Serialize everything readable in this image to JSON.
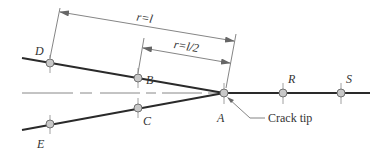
{
  "diagram": {
    "type": "crack-tip quarter-point element geometry",
    "colors": {
      "line": "#2a2a2a",
      "thin_line": "#555555",
      "node_fill": "#c8c8c8",
      "node_stroke": "#666666",
      "background": "#ffffff"
    },
    "dimensions": [
      {
        "label": "r=l"
      },
      {
        "label": "r=l/2"
      }
    ],
    "nodes": [
      {
        "id": "D",
        "label": "D"
      },
      {
        "id": "B",
        "label": "B"
      },
      {
        "id": "A",
        "label": "A"
      },
      {
        "id": "C",
        "label": "C"
      },
      {
        "id": "E",
        "label": "E"
      },
      {
        "id": "R",
        "label": "R"
      },
      {
        "id": "S",
        "label": "S"
      }
    ],
    "annotation": {
      "label": "Crack tip"
    }
  }
}
